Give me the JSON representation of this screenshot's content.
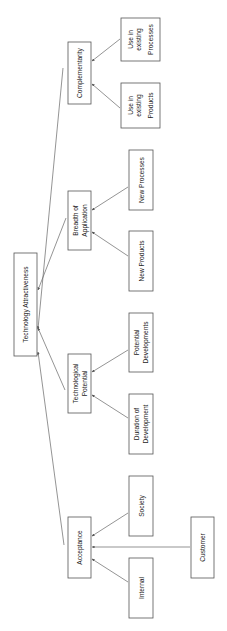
{
  "diagram": {
    "title": "Technology Attractiveness",
    "root": {
      "label": "Technology Attractiveness"
    },
    "categories": [
      {
        "id": "complementarity",
        "lines": [
          "Complementarity"
        ],
        "children": [
          {
            "id": "use-existing-products",
            "lines": [
              "Use in",
              "existing",
              "Products"
            ]
          },
          {
            "id": "use-existing-processes",
            "lines": [
              "Use in",
              "existing",
              "Processes"
            ]
          }
        ]
      },
      {
        "id": "breadth",
        "lines": [
          "Breadth of",
          "Application"
        ],
        "children": [
          {
            "id": "new-products",
            "lines": [
              "New Products"
            ]
          },
          {
            "id": "new-processes",
            "lines": [
              "New Processes"
            ]
          }
        ]
      },
      {
        "id": "tech-potential",
        "lines": [
          "Technological",
          "Potential"
        ],
        "children": [
          {
            "id": "duration",
            "lines": [
              "Duration of",
              "Development"
            ]
          },
          {
            "id": "potential-dev",
            "lines": [
              "Potential",
              "Developments"
            ]
          }
        ]
      },
      {
        "id": "acceptance",
        "lines": [
          "Acceptance"
        ],
        "children": [
          {
            "id": "internal",
            "lines": [
              "Internal"
            ]
          },
          {
            "id": "society",
            "lines": [
              "Society"
            ]
          },
          {
            "id": "customer",
            "lines": [
              "Customer"
            ]
          }
        ]
      }
    ]
  }
}
